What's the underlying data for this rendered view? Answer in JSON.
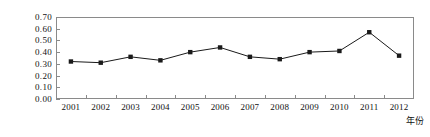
{
  "chart_data": {
    "type": "line",
    "title": "",
    "xlabel": "年份",
    "ylabel": "生态压力指数",
    "categories": [
      "2001",
      "2002",
      "2003",
      "2004",
      "2005",
      "2006",
      "2007",
      "2008",
      "2009",
      "2010",
      "2011",
      "2012"
    ],
    "values": [
      0.32,
      0.31,
      0.36,
      0.33,
      0.4,
      0.44,
      0.36,
      0.34,
      0.4,
      0.41,
      0.57,
      0.37
    ],
    "series": [
      {
        "name": "生态压力指数",
        "values": [
          0.32,
          0.31,
          0.36,
          0.33,
          0.4,
          0.44,
          0.36,
          0.34,
          0.4,
          0.41,
          0.57,
          0.37
        ]
      }
    ],
    "ylim": [
      0.0,
      0.7
    ],
    "ytick_labels": [
      "0.00",
      "0.10",
      "0.20",
      "0.30",
      "0.40",
      "0.50",
      "0.60",
      "0.70"
    ],
    "ytick_values": [
      0.0,
      0.1,
      0.2,
      0.3,
      0.4,
      0.5,
      0.6,
      0.7
    ],
    "xtick_labels": [
      "2001",
      "2002",
      "2003",
      "2004",
      "2005",
      "2006",
      "2007",
      "2008",
      "2009",
      "2010",
      "2011",
      "2012"
    ],
    "grid": false,
    "legend": "none",
    "marker": "filled-square",
    "line_color": "#1a1a1a",
    "marker_color": "#1a1a1a",
    "axis_color": "#8a8a8a",
    "background_color": "#ffffff"
  }
}
